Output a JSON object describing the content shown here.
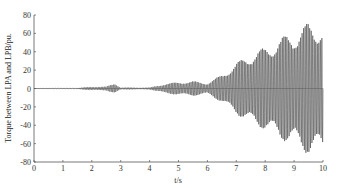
{
  "chart_data": {
    "type": "line",
    "title": "",
    "xlabel": "t/s",
    "ylabel": "Torque between LPA and LPB/pu.",
    "xlim": [
      0,
      10
    ],
    "ylim": [
      -80,
      80
    ],
    "xticks": [
      0,
      1,
      2,
      3,
      4,
      5,
      6,
      7,
      8,
      9,
      10
    ],
    "yticks": [
      80,
      60,
      40,
      20,
      0,
      -20,
      -40,
      -60,
      -80
    ],
    "grid": false,
    "legend": null,
    "series": [
      {
        "name": "Torque between LPA and LPB",
        "description": "Oscillating torque with growing amplitude (envelope +/-)",
        "envelope_t": [
          0,
          1.5,
          2.0,
          2.5,
          2.8,
          3.0,
          4.0,
          4.5,
          5.0,
          5.5,
          6.0,
          6.5,
          7.0,
          7.5,
          8.0,
          8.5,
          9.0,
          9.5,
          10.0
        ],
        "envelope_amp": [
          0,
          0.5,
          2,
          2,
          6,
          1,
          1,
          5,
          7,
          8,
          6,
          15,
          28,
          38,
          45,
          55,
          62,
          72,
          70
        ]
      }
    ],
    "color": "#333333"
  }
}
